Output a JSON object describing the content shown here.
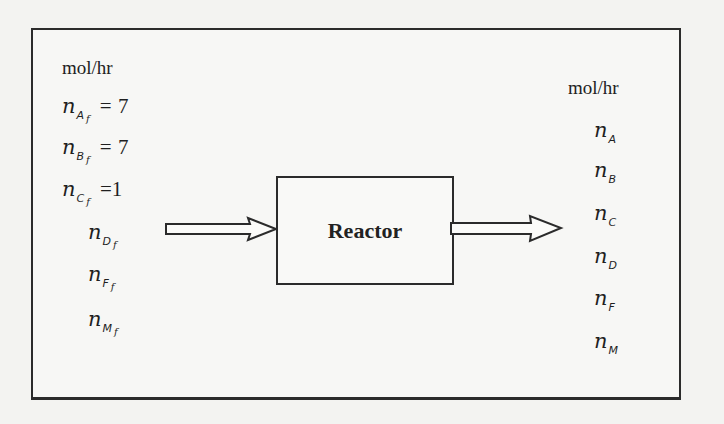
{
  "diagram": {
    "process_unit": {
      "label": "Reactor"
    },
    "inlet": {
      "units": "mol/hr",
      "streams": [
        {
          "symbol": "n",
          "species": "A",
          "subscript_suffix": "f",
          "equals": "=",
          "value": "7"
        },
        {
          "symbol": "n",
          "species": "B",
          "subscript_suffix": "f",
          "equals": "=",
          "value": "7"
        },
        {
          "symbol": "n",
          "species": "C",
          "subscript_suffix": "f",
          "equals": "=",
          "value": "1"
        },
        {
          "symbol": "n",
          "species": "D",
          "subscript_suffix": "f"
        },
        {
          "symbol": "n",
          "species": "F",
          "subscript_suffix": "f"
        },
        {
          "symbol": "n",
          "species": "M",
          "subscript_suffix": "f"
        }
      ]
    },
    "outlet": {
      "units": "mol/hr",
      "streams": [
        {
          "symbol": "n",
          "species": "A"
        },
        {
          "symbol": "n",
          "species": "B"
        },
        {
          "symbol": "n",
          "species": "C"
        },
        {
          "symbol": "n",
          "species": "D"
        },
        {
          "symbol": "n",
          "species": "F"
        },
        {
          "symbol": "n",
          "species": "M"
        }
      ]
    },
    "arrows": {
      "inlet_arrow": "hollow-right-arrow",
      "outlet_arrow": "hollow-right-arrow"
    },
    "colors": {
      "line": "#2b2b2b",
      "background": "#f3f3f1"
    }
  }
}
